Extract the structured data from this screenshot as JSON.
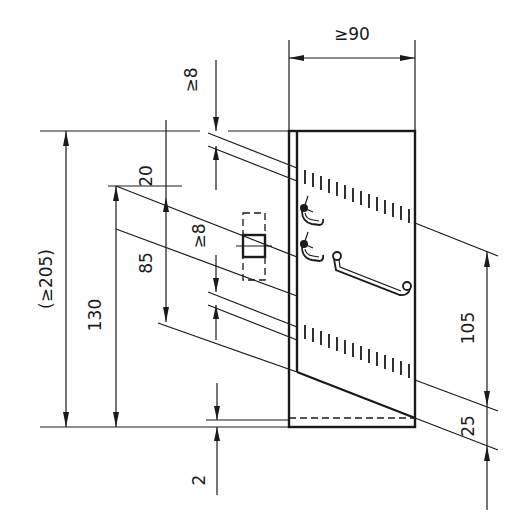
{
  "drawing": {
    "type": "technical dimension drawing",
    "line_color": "#1a1a1a",
    "background": "#ffffff"
  },
  "dimensions": {
    "width_top": "≥90",
    "top_gap": "≥8",
    "overall_height": "(≥205)",
    "lower_height": "130",
    "spacing_20": "20",
    "spacing_85": "85",
    "middle_gap": "≥8",
    "right_105": "105",
    "right_25": "25",
    "bottom_2": "2"
  }
}
